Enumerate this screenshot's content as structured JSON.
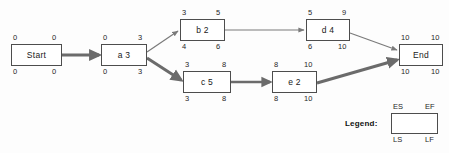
{
  "diagram": {
    "colors": {
      "node_border": "#4d4d4d",
      "node_fill": "#ffffff",
      "edge_normal": "#7a7a7a",
      "edge_critical": "#6b6b6b",
      "text": "#1a1a1a",
      "background": "#fdfdfd"
    },
    "nodes": [
      {
        "id": "start",
        "label": "Start",
        "es": "0",
        "ef": "0",
        "ls": "0",
        "lf": "0",
        "x": 11,
        "y": 44,
        "w": 51,
        "h": 22
      },
      {
        "id": "a",
        "label": "a 3",
        "es": "0",
        "ef": "3",
        "ls": "0",
        "lf": "3",
        "x": 101,
        "y": 44,
        "w": 46,
        "h": 22
      },
      {
        "id": "b",
        "label": "b 2",
        "es": "3",
        "ef": "5",
        "ls": "4",
        "lf": "6",
        "x": 180,
        "y": 19,
        "w": 45,
        "h": 22
      },
      {
        "id": "c",
        "label": "c 5",
        "es": "3",
        "ef": "8",
        "ls": "3",
        "lf": "8",
        "x": 183,
        "y": 71,
        "w": 48,
        "h": 22
      },
      {
        "id": "d",
        "label": "d 4",
        "es": "5",
        "ef": "9",
        "ls": "6",
        "lf": "10",
        "x": 306,
        "y": 19,
        "w": 44,
        "h": 22
      },
      {
        "id": "e",
        "label": "e 2",
        "es": "8",
        "ef": "10",
        "ls": "8",
        "lf": "10",
        "x": 272,
        "y": 71,
        "w": 45,
        "h": 22
      },
      {
        "id": "end",
        "label": "End",
        "es": "10",
        "ef": "10",
        "ls": "10",
        "lf": "10",
        "x": 399,
        "y": 44,
        "w": 44,
        "h": 22
      }
    ],
    "edges": [
      {
        "id": "start-a",
        "from": "start",
        "to": "a",
        "critical": true
      },
      {
        "id": "a-b",
        "from": "a",
        "to": "b",
        "critical": false
      },
      {
        "id": "a-c",
        "from": "a",
        "to": "c",
        "critical": true
      },
      {
        "id": "b-d",
        "from": "b",
        "to": "d",
        "critical": false
      },
      {
        "id": "c-e",
        "from": "c",
        "to": "e",
        "critical": true
      },
      {
        "id": "d-end",
        "from": "d",
        "to": "end",
        "critical": false
      },
      {
        "id": "e-end",
        "from": "e",
        "to": "end",
        "critical": true
      }
    ]
  },
  "legend": {
    "label": "Legend:",
    "es": "ES",
    "ef": "EF",
    "ls": "LS",
    "lf": "LF",
    "box": {
      "x": 391,
      "y": 113,
      "w": 47,
      "h": 21
    },
    "label_pos": {
      "x": 345,
      "y": 119
    }
  }
}
